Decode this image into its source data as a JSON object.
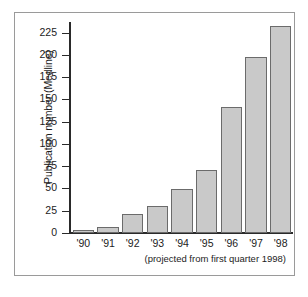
{
  "figure": {
    "y_axis_title": "Publication number (Medline)",
    "footnote": "(projected from first quarter 1998)"
  },
  "chart_data": {
    "type": "bar",
    "title": "",
    "subtitle": "",
    "xlabel": "",
    "ylabel": "Publication number (Medline)",
    "annotation": "(projected from first quarter 1998)",
    "categories": [
      "'90",
      "'91",
      "'92",
      "'93",
      "'94",
      "'95",
      "'96",
      "'97",
      "'98"
    ],
    "values": [
      3,
      7,
      21,
      30,
      49,
      71,
      142,
      198,
      233
    ],
    "ylim": [
      0,
      237
    ],
    "yticks": [
      0,
      25,
      50,
      75,
      100,
      125,
      150,
      175,
      200,
      225
    ],
    "ytick_labels": [
      "0",
      "25",
      "50",
      "75",
      "100",
      "125",
      "150",
      "175",
      "200",
      "225"
    ],
    "grid": false,
    "legend": null,
    "bar_fill_color": "#c9c9c9",
    "bar_edge_color": "#6b6b6b",
    "axis_color": "#2a2a2a",
    "frame_color": "#9a9a9a",
    "background_color": "#ffffff"
  }
}
